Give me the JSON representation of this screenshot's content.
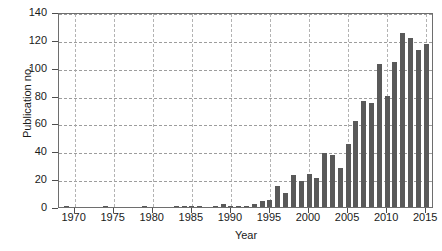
{
  "chart_data": {
    "type": "bar",
    "title": "",
    "xlabel": "Year",
    "ylabel": "Publication no.",
    "xlim": [
      1968,
      2016
    ],
    "ylim": [
      0,
      140
    ],
    "grid": true,
    "legend": null,
    "bar_color": "#595959",
    "axis_color": "#6e6e6e",
    "ytick_labels": [
      "0",
      "20",
      "40",
      "60",
      "80",
      "100",
      "120",
      "140"
    ],
    "ytick_values": [
      0,
      20,
      40,
      60,
      80,
      100,
      120,
      140
    ],
    "xtick_labels": [
      "1970",
      "1975",
      "1980",
      "1985",
      "1990",
      "1995",
      "2000",
      "2005",
      "2010",
      "2015"
    ],
    "xtick_values": [
      1970,
      1975,
      1980,
      1985,
      1990,
      1995,
      2000,
      2005,
      2010,
      2015
    ],
    "categories": [
      1969,
      1970,
      1971,
      1972,
      1973,
      1974,
      1975,
      1976,
      1977,
      1978,
      1979,
      1980,
      1981,
      1982,
      1983,
      1984,
      1985,
      1986,
      1987,
      1988,
      1989,
      1990,
      1991,
      1992,
      1993,
      1994,
      1995,
      1996,
      1997,
      1998,
      1999,
      2000,
      2001,
      2002,
      2003,
      2004,
      2005,
      2006,
      2007,
      2008,
      2009,
      2010,
      2011,
      2012,
      2013,
      2014,
      2015
    ],
    "values": [
      1,
      0,
      0,
      0,
      0,
      1,
      0,
      0,
      0,
      0,
      1,
      0,
      0,
      0,
      1,
      1,
      1,
      1,
      0,
      1,
      2,
      1,
      1,
      1,
      2,
      4,
      5,
      15,
      10,
      23,
      19,
      24,
      21,
      39,
      37,
      28,
      45,
      62,
      76,
      75,
      103,
      80,
      104,
      125,
      121,
      113,
      117
    ]
  }
}
